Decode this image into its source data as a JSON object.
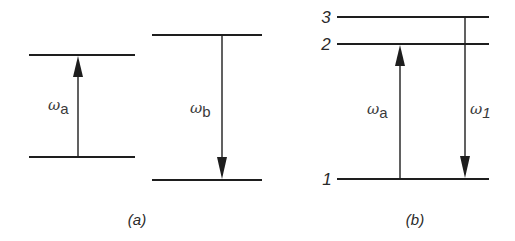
{
  "diagram": {
    "type": "energy-level-diagram",
    "panels": [
      {
        "id": "a",
        "caption": "(a)",
        "transitions": [
          {
            "symbol": "ω",
            "subscript": "a",
            "direction": "up",
            "label": "ωa"
          },
          {
            "symbol": "ω",
            "subscript": "b",
            "direction": "down",
            "label": "ωb"
          }
        ]
      },
      {
        "id": "b",
        "caption": "(b)",
        "levels": [
          {
            "label": "3"
          },
          {
            "label": "2"
          },
          {
            "label": "1"
          }
        ],
        "transitions": [
          {
            "symbol": "ω",
            "subscript": "a",
            "from": "1",
            "to": "2",
            "direction": "up",
            "label": "ωa"
          },
          {
            "symbol": "ω",
            "subscript": "1",
            "from": "3",
            "to": "1",
            "direction": "down",
            "label": "ω1"
          }
        ]
      }
    ],
    "colors": {
      "line": "#1e1e1e",
      "text": "#2a2a2a",
      "background": "#ffffff"
    }
  }
}
